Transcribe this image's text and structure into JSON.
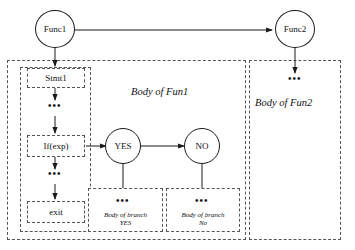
{
  "diagram": {
    "colors": {
      "stroke": "#1a1a1a",
      "dashed_stroke": "#555555",
      "background": "#ffffff",
      "text": "#111111"
    },
    "nodes": {
      "func1": {
        "label": "Func1",
        "shape": "circle"
      },
      "func2": {
        "label": "Func2",
        "shape": "circle"
      },
      "yes": {
        "label": "YES",
        "shape": "circle"
      },
      "no": {
        "label": "NO",
        "shape": "circle"
      }
    },
    "statements": {
      "stmt1": {
        "label": "Stmt1"
      },
      "ifexp": {
        "label": "If(exp)"
      },
      "exit": {
        "label": "exit"
      }
    },
    "containers": {
      "fun1_body": {
        "label": "Body of Fun1"
      },
      "fun2_body": {
        "label": "Body of Fun2"
      }
    },
    "branches": {
      "yes_branch": {
        "line1": "Body of branch",
        "line2": "YES"
      },
      "no_branch": {
        "line1": "Body of branch",
        "line2": "No"
      }
    },
    "ellipses": {
      "stmt_gap": "•••",
      "exit_gap": "•••",
      "yes_branch_gap": "•••",
      "no_branch_gap": "•••",
      "fun2_gap": "•••"
    }
  }
}
